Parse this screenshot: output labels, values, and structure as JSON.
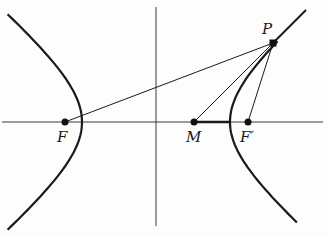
{
  "diagram": {
    "type": "hyperbola-reflection-property",
    "labels": {
      "F": "F",
      "F_prime": "F′",
      "M": "M",
      "P": "P"
    },
    "points": {
      "F": [
        65,
        122
      ],
      "F_prime": [
        248,
        122
      ],
      "M": [
        194,
        122
      ],
      "P": [
        273,
        43
      ],
      "center": [
        156,
        122
      ]
    },
    "hyperbola": {
      "a": 74,
      "b": 62
    },
    "colors": {
      "ink": "#1a1a1a",
      "axis": "#3a3a3a",
      "background": "#fdfdfd"
    }
  }
}
